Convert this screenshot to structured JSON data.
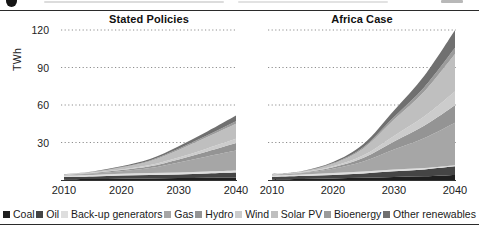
{
  "figure": {
    "panels": [
      {
        "title": "Stated Policies"
      },
      {
        "title": "Africa Case"
      }
    ],
    "y_axis": {
      "label": "TWh",
      "ticks": [
        "120",
        "90",
        "60",
        "30"
      ]
    },
    "x_axis": {
      "ticks": [
        "2010",
        "2020",
        "2030",
        "2040"
      ]
    }
  },
  "legend": {
    "items": [
      {
        "label": "Coal",
        "color": "#1f1f1f"
      },
      {
        "label": "Oil",
        "color": "#454545"
      },
      {
        "label": "Back-up generators",
        "color": "#dedede"
      },
      {
        "label": "Gas",
        "color": "#a6a6a6"
      },
      {
        "label": "Hydro",
        "color": "#949494"
      },
      {
        "label": "Wind",
        "color": "#cccccc"
      },
      {
        "label": "Solar PV",
        "color": "#bfbfbf"
      },
      {
        "label": "Bioenergy",
        "color": "#9b9b9b"
      },
      {
        "label": "Other renewables",
        "color": "#707070"
      }
    ]
  },
  "chart_data": [
    {
      "type": "area",
      "stacked": true,
      "title": "Stated Policies",
      "xlabel": "",
      "ylabel": "TWh",
      "ylim": [
        0,
        130
      ],
      "grid": "dotted-horizontal at 30/60/90/120",
      "x": [
        2010,
        2015,
        2020,
        2025,
        2030,
        2035,
        2040
      ],
      "series": [
        {
          "name": "Coal",
          "values": [
            0.5,
            0.7,
            1.0,
            1.2,
            1.5,
            1.8,
            2.0
          ]
        },
        {
          "name": "Oil",
          "values": [
            2.0,
            2.2,
            2.5,
            2.8,
            3.0,
            3.5,
            4.0
          ]
        },
        {
          "name": "Back-up generators",
          "values": [
            1.0,
            1.2,
            1.5,
            1.5,
            1.5,
            1.5,
            1.5
          ]
        },
        {
          "name": "Gas",
          "values": [
            0.5,
            1.0,
            2.0,
            4.0,
            8.0,
            12.0,
            16.0
          ]
        },
        {
          "name": "Hydro",
          "values": [
            0.3,
            0.5,
            1.0,
            1.5,
            2.5,
            4.0,
            6.0
          ]
        },
        {
          "name": "Wind",
          "values": [
            0.1,
            0.3,
            0.5,
            1.0,
            1.5,
            2.5,
            3.5
          ]
        },
        {
          "name": "Solar PV",
          "values": [
            0.2,
            0.5,
            1.5,
            3.0,
            6.0,
            9.0,
            12.0
          ]
        },
        {
          "name": "Bioenergy",
          "values": [
            0.1,
            0.2,
            0.4,
            0.7,
            1.0,
            1.5,
            2.0
          ]
        },
        {
          "name": "Other renewables",
          "values": [
            0.1,
            0.3,
            0.6,
            1.0,
            2.0,
            3.0,
            4.5
          ]
        }
      ]
    },
    {
      "type": "area",
      "stacked": true,
      "title": "Africa Case",
      "xlabel": "",
      "ylabel": "TWh",
      "ylim": [
        0,
        130
      ],
      "grid": "dotted-horizontal at 30/60/90/120",
      "x": [
        2010,
        2015,
        2020,
        2025,
        2030,
        2035,
        2040
      ],
      "series": [
        {
          "name": "Coal",
          "values": [
            0.5,
            0.8,
            1.2,
            1.8,
            2.5,
            3.0,
            4.0
          ]
        },
        {
          "name": "Oil",
          "values": [
            2.0,
            2.3,
            2.8,
            3.5,
            4.5,
            5.5,
            7.0
          ]
        },
        {
          "name": "Back-up generators",
          "values": [
            1.0,
            1.2,
            1.5,
            1.5,
            1.3,
            1.0,
            0.8
          ]
        },
        {
          "name": "Gas",
          "values": [
            0.5,
            1.2,
            3.5,
            8.0,
            16.0,
            24.0,
            34.0
          ]
        },
        {
          "name": "Hydro",
          "values": [
            0.3,
            0.5,
            1.2,
            3.0,
            6.5,
            10.0,
            14.0
          ]
        },
        {
          "name": "Wind",
          "values": [
            0.1,
            0.3,
            0.8,
            2.0,
            4.5,
            7.5,
            11.0
          ]
        },
        {
          "name": "Solar PV",
          "values": [
            0.2,
            0.5,
            2.0,
            5.5,
            13.0,
            20.0,
            30.0
          ]
        },
        {
          "name": "Bioenergy",
          "values": [
            0.1,
            0.2,
            0.5,
            1.2,
            2.2,
            3.5,
            5.0
          ]
        },
        {
          "name": "Other renewables",
          "values": [
            0.1,
            0.3,
            0.8,
            2.2,
            5.0,
            9.0,
            14.0
          ]
        }
      ]
    }
  ]
}
